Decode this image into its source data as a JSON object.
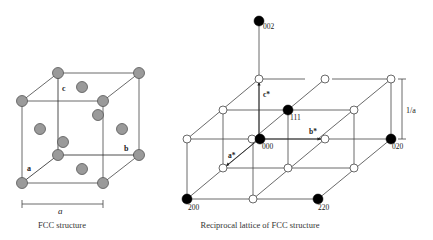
{
  "fcc": {
    "caption": "FCC structure",
    "lattice_param_label": "a",
    "axes": [
      {
        "name": "a",
        "from": [
          58,
          155
        ],
        "to": [
          23,
          182
        ],
        "label": "a",
        "label_pos": [
          27,
          171
        ]
      },
      {
        "name": "b",
        "from": [
          58,
          155
        ],
        "to": [
          137,
          155
        ],
        "label": "b",
        "label_pos": [
          124,
          151
        ]
      },
      {
        "name": "c",
        "from": [
          58,
          155
        ],
        "to": [
          58,
          75
        ],
        "label": "c",
        "label_pos": [
          62,
          91
        ]
      }
    ],
    "edges": [
      [
        [
          22,
          101
        ],
        [
          103,
          101
        ]
      ],
      [
        [
          103,
          101
        ],
        [
          103,
          183
        ]
      ],
      [
        [
          103,
          183
        ],
        [
          22,
          183
        ]
      ],
      [
        [
          22,
          183
        ],
        [
          22,
          101
        ]
      ],
      [
        [
          58,
          73
        ],
        [
          139,
          73
        ]
      ],
      [
        [
          139,
          73
        ],
        [
          139,
          155
        ]
      ],
      [
        [
          22,
          101
        ],
        [
          58,
          73
        ]
      ],
      [
        [
          103,
          101
        ],
        [
          139,
          73
        ]
      ],
      [
        [
          103,
          183
        ],
        [
          139,
          155
        ]
      ]
    ],
    "corner_atoms": [
      [
        22,
        101
      ],
      [
        103,
        101
      ],
      [
        22,
        183
      ],
      [
        103,
        183
      ],
      [
        58,
        73
      ],
      [
        139,
        73
      ],
      [
        139,
        155
      ],
      [
        58,
        155
      ]
    ],
    "face_atoms": [
      [
        82,
        87
      ],
      [
        40,
        129
      ],
      [
        122,
        129
      ],
      [
        63,
        142
      ],
      [
        98,
        115
      ],
      [
        82,
        169
      ]
    ],
    "atom_fill": "#9a9a9a",
    "atom_stroke": "#555555",
    "dimension": {
      "x1": 22,
      "x2": 103,
      "y": 204,
      "label_pos": [
        58,
        214
      ]
    }
  },
  "reciprocal": {
    "caption": "Reciprocal lattice of FCC structure",
    "dimension": {
      "label": "1/a",
      "x": 402,
      "y1": 79,
      "y2": 139,
      "label_pos": [
        406,
        113
      ]
    },
    "edges": [
      [
        [
          259,
          79
        ],
        [
          305,
          79
        ]
      ],
      [
        [
          332,
          79
        ],
        [
          391,
          79
        ]
      ],
      [
        [
          223,
          110
        ],
        [
          354,
          110
        ]
      ],
      [
        [
          187,
          139
        ],
        [
          391,
          139
        ]
      ],
      [
        [
          223,
          168
        ],
        [
          354,
          168
        ]
      ],
      [
        [
          187,
          199
        ],
        [
          318,
          199
        ]
      ],
      [
        [
          259,
          79
        ],
        [
          187,
          139
        ]
      ],
      [
        [
          325,
          79
        ],
        [
          253,
          139
        ]
      ],
      [
        [
          391,
          79
        ],
        [
          318,
          139
        ]
      ],
      [
        [
          391,
          79
        ],
        [
          391,
          139
        ]
      ],
      [
        [
          187,
          139
        ],
        [
          187,
          199
        ]
      ],
      [
        [
          223,
          110
        ],
        [
          223,
          168
        ]
      ],
      [
        [
          253,
          139
        ],
        [
          253,
          199
        ]
      ],
      [
        [
          288,
          110
        ],
        [
          288,
          168
        ]
      ],
      [
        [
          354,
          110
        ],
        [
          354,
          168
        ]
      ],
      [
        [
          259,
          139
        ],
        [
          187,
          199
        ]
      ],
      [
        [
          325,
          139
        ],
        [
          253,
          199
        ]
      ],
      [
        [
          391,
          139
        ],
        [
          318,
          199
        ]
      ],
      [
        [
          259,
          21
        ],
        [
          259,
          139
        ]
      ]
    ],
    "axes": [
      {
        "name": "a*",
        "from": [
          259,
          139
        ],
        "to": [
          226,
          166
        ],
        "label": "a*",
        "label_pos": [
          228,
          158
        ]
      },
      {
        "name": "b*",
        "from": [
          259,
          139
        ],
        "to": [
          321,
          139
        ],
        "label": "b*",
        "label_pos": [
          309,
          134
        ]
      },
      {
        "name": "c*",
        "from": [
          259,
          139
        ],
        "to": [
          259,
          82
        ],
        "label": "c*",
        "label_pos": [
          263,
          97
        ]
      }
    ],
    "open_nodes": [
      [
        259,
        79
      ],
      [
        325,
        79
      ],
      [
        391,
        79
      ],
      [
        223,
        110
      ],
      [
        354,
        110
      ],
      [
        187,
        139
      ],
      [
        252,
        139
      ],
      [
        325,
        139
      ],
      [
        223,
        168
      ],
      [
        288,
        168
      ],
      [
        354,
        168
      ],
      [
        253,
        199
      ]
    ],
    "filled_nodes": [
      {
        "pos": [
          259,
          21
        ],
        "label": "002",
        "label_pos": [
          263,
          29
        ]
      },
      {
        "pos": [
          288,
          110
        ],
        "label": "111",
        "label_pos": [
          290,
          120
        ]
      },
      {
        "pos": [
          260,
          139
        ],
        "label": "000",
        "label_pos": [
          262,
          149
        ]
      },
      {
        "pos": [
          391,
          139
        ],
        "label": "020",
        "label_pos": [
          392,
          149
        ]
      },
      {
        "pos": [
          187,
          199
        ],
        "label": "200",
        "label_pos": [
          188,
          210
        ]
      },
      {
        "pos": [
          318,
          199
        ],
        "label": "220",
        "label_pos": [
          318,
          210
        ]
      }
    ]
  }
}
